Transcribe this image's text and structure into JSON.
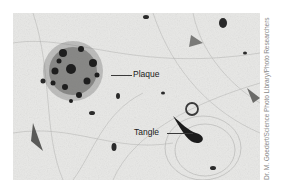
{
  "figure": {
    "labels": {
      "plaque": "Plaque",
      "tangle": "Tangle"
    },
    "credit": "Dr. M. Goedert/Science Photo Library/Photo Researchers"
  }
}
